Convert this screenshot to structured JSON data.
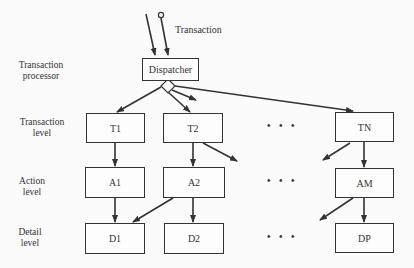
{
  "diagram": {
    "input_label": "Transaction",
    "dispatcher": "Dispatcher",
    "levels": [
      {
        "line1": "Transaction",
        "line2": "processor"
      },
      {
        "line1": "Transaction",
        "line2": "level"
      },
      {
        "line1": "Action",
        "line2": "level"
      },
      {
        "line1": "Detail",
        "line2": "level"
      }
    ],
    "transaction_nodes": [
      "T1",
      "T2",
      "TN"
    ],
    "action_nodes": [
      "A1",
      "A2",
      "AM"
    ],
    "detail_nodes": [
      "D1",
      "D2",
      "DP"
    ],
    "ellipsis": "• • •",
    "colors": {
      "line": "#333333",
      "background": "#fbfbfb"
    }
  }
}
